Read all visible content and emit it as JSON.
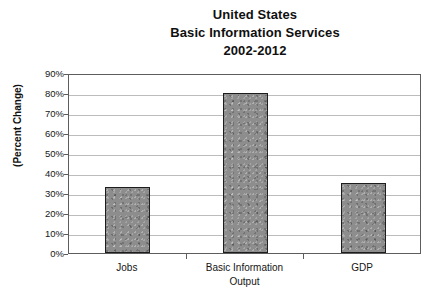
{
  "chart_data": {
    "type": "bar",
    "title": "United States Basic Information Services 2002-2012",
    "title_lines": [
      "United States",
      "Basic Information Services",
      "2002-2012"
    ],
    "categories": [
      "Jobs",
      "Basic Information",
      "GDP"
    ],
    "values": [
      33,
      80,
      35
    ],
    "value_labels": [
      "33%",
      "80%",
      "35%"
    ],
    "xlabel": "Output",
    "ylabel": "(Percent Change)",
    "ylim": [
      0,
      90
    ],
    "ytick_values": [
      0,
      10,
      20,
      30,
      40,
      50,
      60,
      70,
      80,
      90
    ],
    "ytick_labels": [
      "0%",
      "10%",
      "20%",
      "30%",
      "40%",
      "50%",
      "60%",
      "70%",
      "80%",
      "90%"
    ],
    "grid": true,
    "legend": false,
    "bar_fill_color": "#8d8d8d",
    "bar_edge_color": "#1d1d1d",
    "gridline_color": "#bcbcbc",
    "axis_color": "#5d5d5d",
    "background_color": "#ffffff"
  }
}
